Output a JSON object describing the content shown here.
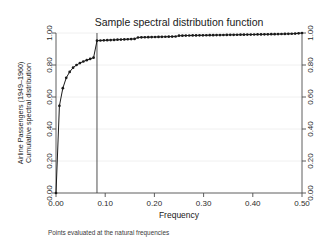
{
  "chart_data": {
    "type": "line",
    "title": "Sample spectral distribution function",
    "xlabel": "Frequency",
    "ylabel_line1": "Airline Passengers (1949–1960)",
    "ylabel_line2": "Cumulative spectral distribution",
    "note": "Points evaluated at the natural frequencies",
    "xlim": [
      0.0,
      0.5
    ],
    "ylim": [
      0.0,
      1.0
    ],
    "grid": true,
    "legend": "none",
    "markers": "filled-circle",
    "right_axis_mirrored": true,
    "xticks": [
      "0.00",
      "0.10",
      "0.20",
      "0.30",
      "0.40",
      "0.50"
    ],
    "xtick_values": [
      0.0,
      0.1,
      0.2,
      0.3,
      0.4,
      0.5
    ],
    "yticks": [
      "0.00",
      "0.20",
      "0.40",
      "0.60",
      "0.80",
      "1.00"
    ],
    "ytick_values": [
      0.0,
      0.2,
      0.4,
      0.6,
      0.8,
      1.0
    ],
    "yticks_right": [
      "0.00",
      "0.20",
      "0.40",
      "0.60",
      "0.80",
      "1.00"
    ],
    "reference_line_x": 0.0833,
    "x": [
      0.0,
      0.00694,
      0.01389,
      0.02083,
      0.02778,
      0.03472,
      0.04167,
      0.04861,
      0.05556,
      0.0625,
      0.06944,
      0.07639,
      0.08333,
      0.09028,
      0.09722,
      0.10417,
      0.11111,
      0.11806,
      0.125,
      0.13194,
      0.13889,
      0.14583,
      0.15278,
      0.15972,
      0.16667,
      0.17361,
      0.18056,
      0.1875,
      0.19444,
      0.20139,
      0.20833,
      0.21528,
      0.22222,
      0.22917,
      0.23611,
      0.24306,
      0.25,
      0.25694,
      0.26389,
      0.27083,
      0.27778,
      0.28472,
      0.29167,
      0.29861,
      0.30556,
      0.3125,
      0.31944,
      0.32639,
      0.33333,
      0.34028,
      0.34722,
      0.35417,
      0.36111,
      0.36806,
      0.375,
      0.38194,
      0.38889,
      0.39583,
      0.40278,
      0.40972,
      0.41667,
      0.42361,
      0.43056,
      0.4375,
      0.44444,
      0.45139,
      0.45833,
      0.46528,
      0.47222,
      0.47917,
      0.48611,
      0.49306,
      0.5
    ],
    "y": [
      0.0,
      0.545,
      0.655,
      0.72,
      0.757,
      0.783,
      0.8,
      0.812,
      0.822,
      0.83,
      0.838,
      0.846,
      0.952,
      0.953,
      0.954,
      0.955,
      0.956,
      0.957,
      0.958,
      0.959,
      0.96,
      0.961,
      0.962,
      0.963,
      0.972,
      0.973,
      0.9735,
      0.974,
      0.9745,
      0.975,
      0.9755,
      0.976,
      0.9765,
      0.977,
      0.9775,
      0.978,
      0.983,
      0.9835,
      0.984,
      0.9843,
      0.9846,
      0.985,
      0.9853,
      0.9856,
      0.986,
      0.9863,
      0.9866,
      0.987,
      0.9873,
      0.9876,
      0.988,
      0.9883,
      0.9886,
      0.989,
      0.9893,
      0.9896,
      0.99,
      0.9903,
      0.9906,
      0.991,
      0.9913,
      0.9916,
      0.992,
      0.9924,
      0.9928,
      0.9932,
      0.9936,
      0.994,
      0.9946,
      0.9952,
      0.9962,
      0.9978,
      1.0
    ]
  }
}
